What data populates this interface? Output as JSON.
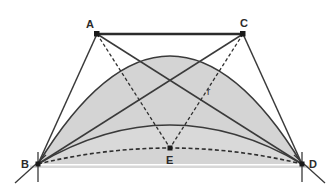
{
  "figure": {
    "kind": "geometry-diagram",
    "canvas": {
      "width": 334,
      "height": 190
    },
    "background_color": "#ffffff",
    "fill_color": "#d4d4d4",
    "fill_color_light": "#dcdcdc",
    "stroke_color": "#3a3a3a",
    "point_color": "#1a1a1a"
  },
  "labels": {
    "A": "A",
    "B": "B",
    "C": "C",
    "D": "D",
    "E": "E",
    "r": "r"
  },
  "points": [
    {
      "name": "A",
      "label": "A",
      "x": 97,
      "y": 34,
      "label_x": 88,
      "label_y": 26
    },
    {
      "name": "B",
      "label": "B",
      "x": 38,
      "y": 164,
      "label_x": 25,
      "label_y": 167
    },
    {
      "name": "C",
      "label": "C",
      "x": 243,
      "y": 34,
      "label_x": 241,
      "label_y": 26
    },
    {
      "name": "D",
      "label": "D",
      "x": 302,
      "y": 164,
      "label_x": 310,
      "label_y": 167
    },
    {
      "name": "E",
      "label": "E",
      "x": 170,
      "y": 148,
      "label_x": 167,
      "label_y": 162
    }
  ],
  "annotations": [
    {
      "name": "radius-label",
      "text": "r",
      "x": 208,
      "y": 94
    }
  ],
  "segments_solid": [
    {
      "name": "segment-AC",
      "from": "A",
      "to": "C",
      "width": 2.2
    },
    {
      "name": "segment-AB",
      "from": "A",
      "to": "B",
      "width": 1.4
    },
    {
      "name": "segment-AD",
      "from": "A",
      "to": "D",
      "width": 1.4
    },
    {
      "name": "segment-CB",
      "from": "C",
      "to": "B",
      "width": 1.4
    },
    {
      "name": "segment-CD",
      "from": "C",
      "to": "D",
      "width": 1.4
    }
  ],
  "segments_dashed": [
    {
      "name": "segment-AE",
      "from": "A",
      "to": "E"
    },
    {
      "name": "segment-CE",
      "from": "C",
      "to": "E"
    }
  ],
  "arcs": [
    {
      "name": "outer-semicircle-arc",
      "style": "solid",
      "from": "B",
      "to": "D",
      "apex_y": 12
    },
    {
      "name": "inner-arc-BD",
      "style": "solid",
      "from": "B",
      "to": "D",
      "apex_y": 125
    },
    {
      "name": "dashed-arc-BED",
      "style": "dashed",
      "from": "B",
      "to": "D",
      "apex_y": 148
    }
  ],
  "tick_marks": [
    {
      "name": "tick-at-B-outer"
    },
    {
      "name": "tick-at-B-vertical"
    },
    {
      "name": "tick-at-D-outer"
    },
    {
      "name": "tick-at-D-vertical"
    }
  ]
}
